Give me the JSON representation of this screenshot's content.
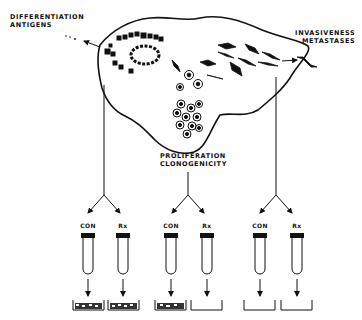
{
  "labels": {
    "differentiation_line1": "DIFFERENTIATION",
    "differentiation_line2": "ANTIGENS",
    "invasiveness_line1": "INVASIVENESS",
    "invasiveness_line2": "METASTASES",
    "proliferation_line1": "PROLIFERATION",
    "proliferation_line2": "CLONOGENICITY"
  },
  "tube_groups": [
    {
      "name": "differentiation",
      "tubes": [
        {
          "label": "CON",
          "dish": "filled-colonies"
        },
        {
          "label": "Rx",
          "dish": "filled-colonies"
        }
      ]
    },
    {
      "name": "proliferation",
      "tubes": [
        {
          "label": "CON",
          "dish": "filled-colonies"
        },
        {
          "label": "Rx",
          "dish": "empty"
        }
      ]
    },
    {
      "name": "invasiveness",
      "tubes": [
        {
          "label": "CON",
          "dish": "empty"
        },
        {
          "label": "Rx",
          "dish": "empty"
        }
      ]
    }
  ],
  "colors": {
    "ink": "#111111",
    "background": "#ffffff"
  }
}
